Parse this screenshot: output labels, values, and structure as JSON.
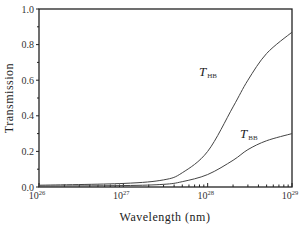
{
  "chart_data": {
    "type": "line",
    "title": "",
    "xlabel": "Wavelength (nm)",
    "ylabel": "Transmission",
    "xscale": "log",
    "xlim": [
      1e+26,
      1e+29
    ],
    "ylim": [
      0.0,
      1.0
    ],
    "grid": false,
    "x_ticks": [
      {
        "base": "10",
        "exp": "26"
      },
      {
        "base": "10",
        "exp": "27"
      },
      {
        "base": "10",
        "exp": "28"
      },
      {
        "base": "10",
        "exp": "29"
      }
    ],
    "y_ticks": [
      "0.0",
      "0.2",
      "0.4",
      "0.6",
      "0.8",
      "1.0"
    ],
    "x": [
      1e+26,
      1e+27,
      3e+27,
      5e+27,
      1e+28,
      2e+28,
      3e+28,
      5e+28,
      1e+29
    ],
    "series": [
      {
        "name": "T_HB",
        "label_main": "T",
        "label_sub": "HB",
        "values": [
          0.01,
          0.02,
          0.04,
          0.08,
          0.2,
          0.45,
          0.6,
          0.75,
          0.87
        ]
      },
      {
        "name": "T_BB",
        "label_main": "T",
        "label_sub": "BB",
        "values": [
          0.005,
          0.008,
          0.015,
          0.03,
          0.07,
          0.15,
          0.21,
          0.26,
          0.3
        ]
      }
    ],
    "legend": "inline labels next to curves"
  }
}
